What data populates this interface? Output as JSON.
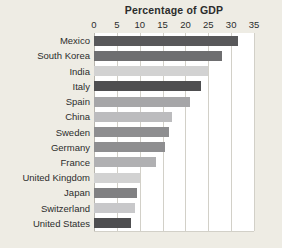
{
  "chart_data": {
    "type": "bar",
    "orientation": "horizontal",
    "title": "Percentage of GDP",
    "xlabel": "",
    "ylabel": "",
    "xlim": [
      0,
      35
    ],
    "xticks": [
      0,
      5,
      10,
      15,
      20,
      25,
      30,
      35
    ],
    "xtick_labels": [
      "0",
      "5",
      "10",
      "15",
      "20",
      "25",
      "30",
      "35"
    ],
    "grid": true,
    "legend": "none",
    "categories": [
      "Mexico",
      "South Korea",
      "India",
      "Italy",
      "Spain",
      "China",
      "Sweden",
      "Germany",
      "France",
      "United Kingdom",
      "Japan",
      "Switzerland",
      "United States"
    ],
    "values": [
      31.5,
      28.0,
      25.0,
      23.5,
      21.0,
      17.0,
      16.5,
      15.5,
      13.5,
      10.0,
      9.5,
      9.0,
      8.0
    ],
    "bar_colors": [
      "#58585a",
      "#6e6e70",
      "#d2d2d2",
      "#4e4e50",
      "#a6a6a8",
      "#bcbcbe",
      "#8e8e90",
      "#8e8e90",
      "#b0b0b2",
      "#d2d2d2",
      "#808082",
      "#c8c8ca",
      "#4e4e50"
    ]
  },
  "style": {
    "background": "#eeece4",
    "plot_background": "#ffffff",
    "gridline_color": "#d2d0c8",
    "text_color": "#2c2c2c"
  }
}
